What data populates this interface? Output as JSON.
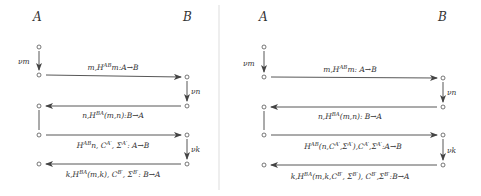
{
  "divider": {
    "x": 219,
    "color": "#dddddd"
  },
  "panels": [
    {
      "id": "left",
      "parties": {
        "a": "A",
        "b": "B"
      },
      "steps": [
        {
          "label": "νm"
        },
        {
          "label": "νn"
        },
        {
          "label": "νk"
        }
      ],
      "messages": [
        {
          "direction": "A→B",
          "text": "m,H^AB m: A→B"
        },
        {
          "direction": "B→A",
          "text": "n,H^BA(m,n): B→A"
        },
        {
          "direction": "A→B",
          "text": "H^AB n, C^A', Σ^A': A→B"
        },
        {
          "direction": "B→A",
          "text": "k,H^BA(m,k), C^B', Σ^B': B→A"
        }
      ]
    },
    {
      "id": "right",
      "parties": {
        "a": "A",
        "b": "B"
      },
      "steps": [
        {
          "label": "νm"
        },
        {
          "label": "νn"
        },
        {
          "label": "νk"
        }
      ],
      "messages": [
        {
          "direction": "A→B",
          "text": "m,H^AB m: A→B"
        },
        {
          "direction": "B→A",
          "text": "n,H^BA(m,n): B→A"
        },
        {
          "direction": "A→B",
          "text": "H^AB(n,C^A',Σ^A'),C^A',Σ^A': A→B"
        },
        {
          "direction": "B→A",
          "text": "k,H^BA(m,k,C^B', Σ^B'), C^B',Σ^B': B→A"
        }
      ]
    }
  ]
}
